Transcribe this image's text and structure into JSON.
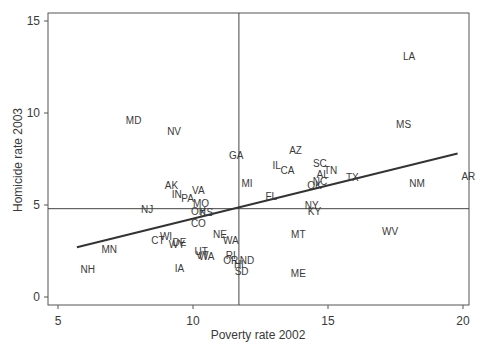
{
  "chart_data": {
    "type": "scatter",
    "title": "",
    "xlabel": "Poverty rate 2002",
    "ylabel": "Homicide rate 2003",
    "xlim": [
      4.7,
      20.3
    ],
    "ylim": [
      -0.4,
      15.5
    ],
    "xticks": [
      5,
      10,
      15,
      20
    ],
    "yticks": [
      0,
      5,
      10,
      15
    ],
    "grid": false,
    "legend": null,
    "reference_lines": {
      "vertical_x_mean": 11.7,
      "horizontal_y_mean": 4.8
    },
    "regression_line": {
      "x": [
        5.7,
        19.8
      ],
      "y": [
        2.7,
        7.8
      ]
    },
    "points": [
      {
        "label": "LA",
        "x": 18.0,
        "y": 13.1
      },
      {
        "label": "MD",
        "x": 7.8,
        "y": 9.6
      },
      {
        "label": "NV",
        "x": 9.3,
        "y": 9.0
      },
      {
        "label": "MS",
        "x": 17.8,
        "y": 9.4
      },
      {
        "label": "GA",
        "x": 11.6,
        "y": 7.7
      },
      {
        "label": "AZ",
        "x": 13.8,
        "y": 8.0
      },
      {
        "label": "IL",
        "x": 13.1,
        "y": 7.2
      },
      {
        "label": "CA",
        "x": 13.5,
        "y": 6.9
      },
      {
        "label": "SC",
        "x": 14.7,
        "y": 7.3
      },
      {
        "label": "TN",
        "x": 15.1,
        "y": 6.9
      },
      {
        "label": "AL",
        "x": 14.8,
        "y": 6.7
      },
      {
        "label": "NC",
        "x": 14.7,
        "y": 6.3
      },
      {
        "label": "OK",
        "x": 14.5,
        "y": 6.1
      },
      {
        "label": "TX",
        "x": 15.9,
        "y": 6.5
      },
      {
        "label": "NM",
        "x": 18.3,
        "y": 6.2
      },
      {
        "label": "AR",
        "x": 20.2,
        "y": 6.6
      },
      {
        "label": "MI",
        "x": 12.0,
        "y": 6.2
      },
      {
        "label": "FL",
        "x": 12.9,
        "y": 5.5
      },
      {
        "label": "AK",
        "x": 9.2,
        "y": 6.1
      },
      {
        "label": "IN",
        "x": 9.4,
        "y": 5.6
      },
      {
        "label": "VA",
        "x": 10.2,
        "y": 5.8
      },
      {
        "label": "PA",
        "x": 9.8,
        "y": 5.4
      },
      {
        "label": "MO",
        "x": 10.3,
        "y": 5.1
      },
      {
        "label": "NJ",
        "x": 8.3,
        "y": 4.8
      },
      {
        "label": "OH",
        "x": 10.2,
        "y": 4.7
      },
      {
        "label": "KS",
        "x": 10.5,
        "y": 4.6
      },
      {
        "label": "NY",
        "x": 14.4,
        "y": 5.0
      },
      {
        "label": "KY",
        "x": 14.5,
        "y": 4.7
      },
      {
        "label": "CO",
        "x": 10.2,
        "y": 4.0
      },
      {
        "label": "NE",
        "x": 11.0,
        "y": 3.4
      },
      {
        "label": "WA",
        "x": 11.4,
        "y": 3.1
      },
      {
        "label": "MT",
        "x": 13.9,
        "y": 3.4
      },
      {
        "label": "WV",
        "x": 17.3,
        "y": 3.6
      },
      {
        "label": "WI",
        "x": 9.0,
        "y": 3.3
      },
      {
        "label": "CT",
        "x": 8.7,
        "y": 3.1
      },
      {
        "label": "DE",
        "x": 9.5,
        "y": 3.0
      },
      {
        "label": "WY",
        "x": 9.4,
        "y": 2.9
      },
      {
        "label": "UT",
        "x": 10.3,
        "y": 2.5
      },
      {
        "label": "VT",
        "x": 10.35,
        "y": 2.3
      },
      {
        "label": "WA",
        "x": 10.5,
        "y": 2.25
      },
      {
        "label": "MN",
        "x": 6.9,
        "y": 2.6
      },
      {
        "label": "NH",
        "x": 6.1,
        "y": 1.5
      },
      {
        "label": "IA",
        "x": 9.5,
        "y": 1.6
      },
      {
        "label": "RI",
        "x": 11.4,
        "y": 2.3
      },
      {
        "label": "OR",
        "x": 11.4,
        "y": 2.0
      },
      {
        "label": "ND",
        "x": 12.0,
        "y": 2.0
      },
      {
        "label": "HI",
        "x": 11.7,
        "y": 1.8
      },
      {
        "label": "SD",
        "x": 11.8,
        "y": 1.4
      },
      {
        "label": "ME",
        "x": 13.9,
        "y": 1.3
      }
    ]
  }
}
